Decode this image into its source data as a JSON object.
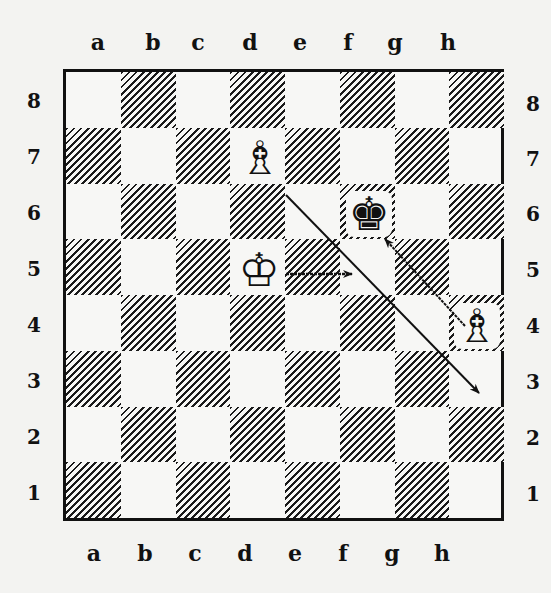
{
  "board": {
    "files": [
      "a",
      "b",
      "c",
      "d",
      "e",
      "f",
      "g",
      "h"
    ],
    "ranks": [
      "8",
      "7",
      "6",
      "5",
      "4",
      "3",
      "2",
      "1"
    ],
    "pieces": [
      {
        "square": "d7",
        "piece": "white-bishop",
        "glyph": "♗"
      },
      {
        "square": "f6",
        "piece": "black-king",
        "glyph": "♚"
      },
      {
        "square": "d5",
        "piece": "white-king",
        "glyph": "♔"
      },
      {
        "square": "h4",
        "piece": "white-bishop",
        "glyph": "♗"
      }
    ],
    "arrows": [
      {
        "from": "d5",
        "to": "e5",
        "style": "single"
      },
      {
        "from": "h4",
        "to": "f6",
        "style": "double"
      },
      {
        "from": "d7",
        "to": "h3",
        "style": "single"
      }
    ]
  }
}
